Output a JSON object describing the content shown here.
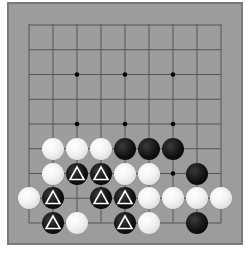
{
  "board": {
    "size_cols": 9,
    "size_rows": 9,
    "grid_origin_x": 29,
    "grid_origin_y": 25,
    "spacing_x": 24,
    "spacing_y": 24.75,
    "star_points": [
      [
        2,
        2
      ],
      [
        4,
        2
      ],
      [
        6,
        2
      ],
      [
        2,
        4
      ],
      [
        4,
        4
      ],
      [
        6,
        4
      ],
      [
        6,
        6
      ]
    ],
    "colors": {
      "board": "#9c9c9c",
      "line": "#555555",
      "marker": "#ffffff"
    }
  },
  "stones": [
    {
      "col": 1,
      "row": 5,
      "color": "white",
      "mark": null
    },
    {
      "col": 2,
      "row": 5,
      "color": "white",
      "mark": null
    },
    {
      "col": 3,
      "row": 5,
      "color": "white",
      "mark": null
    },
    {
      "col": 4,
      "row": 5,
      "color": "black",
      "mark": null
    },
    {
      "col": 5,
      "row": 5,
      "color": "black",
      "mark": null
    },
    {
      "col": 6,
      "row": 5,
      "color": "black",
      "mark": null
    },
    {
      "col": 1,
      "row": 6,
      "color": "white",
      "mark": null
    },
    {
      "col": 2,
      "row": 6,
      "color": "black",
      "mark": "triangle"
    },
    {
      "col": 3,
      "row": 6,
      "color": "black",
      "mark": "triangle"
    },
    {
      "col": 4,
      "row": 6,
      "color": "white",
      "mark": null
    },
    {
      "col": 5,
      "row": 6,
      "color": "white",
      "mark": null
    },
    {
      "col": 7,
      "row": 6,
      "color": "black",
      "mark": null
    },
    {
      "col": 0,
      "row": 7,
      "color": "white",
      "mark": null
    },
    {
      "col": 1,
      "row": 7,
      "color": "black",
      "mark": "triangle"
    },
    {
      "col": 3,
      "row": 7,
      "color": "black",
      "mark": "triangle"
    },
    {
      "col": 4,
      "row": 7,
      "color": "black",
      "mark": "triangle"
    },
    {
      "col": 5,
      "row": 7,
      "color": "white",
      "mark": null
    },
    {
      "col": 6,
      "row": 7,
      "color": "white",
      "mark": null
    },
    {
      "col": 7,
      "row": 7,
      "color": "white",
      "mark": null
    },
    {
      "col": 8,
      "row": 7,
      "color": "white",
      "mark": null
    },
    {
      "col": 1,
      "row": 8,
      "color": "black",
      "mark": "triangle"
    },
    {
      "col": 2,
      "row": 8,
      "color": "white",
      "mark": null
    },
    {
      "col": 4,
      "row": 8,
      "color": "black",
      "mark": "triangle"
    },
    {
      "col": 5,
      "row": 8,
      "color": "white",
      "mark": null
    },
    {
      "col": 7,
      "row": 8,
      "color": "black",
      "mark": null
    }
  ]
}
